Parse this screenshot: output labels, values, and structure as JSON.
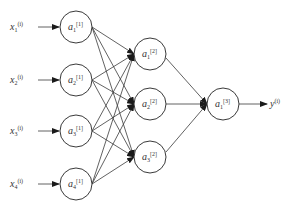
{
  "diagram": {
    "type": "neural-network",
    "colors": {
      "stroke": "#3a3a3a",
      "text": "#333333",
      "background": "#ffffff"
    },
    "inputs": [
      {
        "base": "x",
        "sub": "1",
        "sup": "(i)"
      },
      {
        "base": "x",
        "sub": "2",
        "sup": "(i)"
      },
      {
        "base": "x",
        "sub": "3",
        "sup": "(i)"
      },
      {
        "base": "x",
        "sub": "4",
        "sup": "(i)"
      }
    ],
    "layer1": [
      {
        "base": "a",
        "sub": "1",
        "sup": "[1]"
      },
      {
        "base": "a",
        "sub": "2",
        "sup": "[1]"
      },
      {
        "base": "a",
        "sub": "3",
        "sup": "[1]"
      },
      {
        "base": "a",
        "sub": "4",
        "sup": "[1]"
      }
    ],
    "layer2": [
      {
        "base": "a",
        "sub": "1",
        "sup": "[2]"
      },
      {
        "base": "a",
        "sub": "2",
        "sup": "[2]"
      },
      {
        "base": "a",
        "sub": "3",
        "sup": "[2]"
      }
    ],
    "layer3": [
      {
        "base": "a",
        "sub": "1",
        "sup": "[3]"
      }
    ],
    "output": {
      "base": "y",
      "sup": "(i)"
    }
  }
}
